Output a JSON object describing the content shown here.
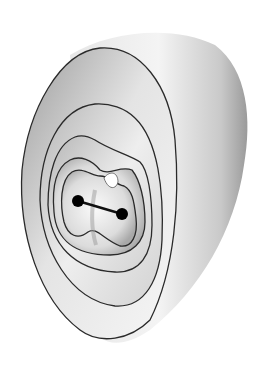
{
  "figure": {
    "colors": {
      "background": "#ffffff",
      "shell_light": "#f2f2f2",
      "shell_mid": "#c8c8c8",
      "shell_dark": "#8a8a8a",
      "contour_line": "#2a2a2a",
      "node": "#000000"
    },
    "contour_count": 5,
    "nodes": [
      {
        "id": "node-left",
        "cx": 78,
        "cy": 201
      },
      {
        "id": "node-right",
        "cx": 122,
        "cy": 214
      }
    ],
    "bond": {
      "from": "node-left",
      "to": "node-right"
    }
  }
}
